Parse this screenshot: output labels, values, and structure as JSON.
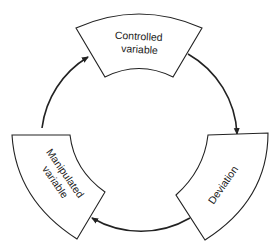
{
  "diagram": {
    "type": "cycle",
    "direction": "clockwise",
    "nodes": [
      {
        "id": "controlled",
        "lines": [
          "Controlled",
          "variable"
        ]
      },
      {
        "id": "deviation",
        "lines": [
          "Deviation"
        ]
      },
      {
        "id": "manipulated",
        "lines": [
          "Manipulated",
          "variable"
        ]
      }
    ],
    "edges": [
      {
        "from": "controlled",
        "to": "deviation"
      },
      {
        "from": "deviation",
        "to": "manipulated"
      },
      {
        "from": "manipulated",
        "to": "controlled"
      }
    ],
    "colors": {
      "stroke": "#222222",
      "fill": "#ffffff",
      "background": "#ffffff"
    }
  }
}
